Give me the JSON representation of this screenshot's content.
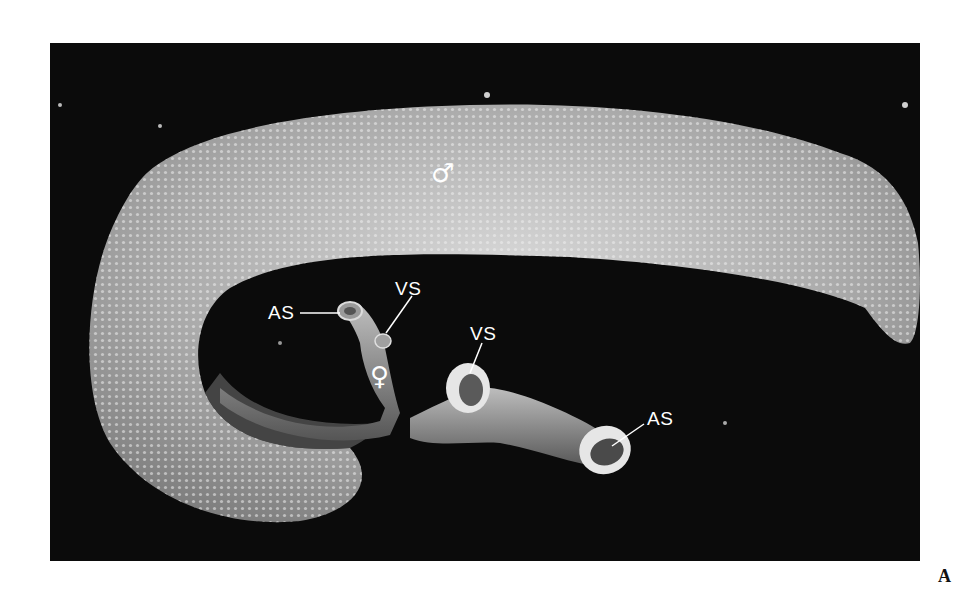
{
  "figure": {
    "panel_letter": "A",
    "background_color": "#0b0b0b",
    "specimen_color": "#cfcfcf"
  },
  "labels": {
    "male_symbol": "♂",
    "female_symbol": "♀",
    "as_female": "AS",
    "vs_female": "VS",
    "vs_male": "VS",
    "as_male": "AS"
  }
}
